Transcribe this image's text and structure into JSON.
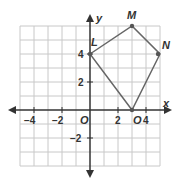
{
  "diagram": {
    "type": "coordinate-plane",
    "axes": {
      "x_label": "x",
      "y_label": "y",
      "origin_label": "O"
    },
    "x_ticks": [
      {
        "value": -4,
        "label": "−4"
      },
      {
        "value": -2,
        "label": "−2"
      },
      {
        "value": 2,
        "label": "2"
      },
      {
        "value": 4,
        "label": "4"
      }
    ],
    "y_ticks": [
      {
        "value": 4,
        "label": "4"
      },
      {
        "value": 2,
        "label": "2"
      },
      {
        "value": -2,
        "label": "−2"
      }
    ],
    "grid": {
      "x_min": -5,
      "x_max": 5,
      "y_min": -4,
      "y_max": 6
    },
    "polygon": {
      "vertices": [
        {
          "name": "L",
          "x": 0,
          "y": 4
        },
        {
          "name": "M",
          "x": 3,
          "y": 6
        },
        {
          "name": "N",
          "x": 5,
          "y": 4
        },
        {
          "name": "O",
          "x": 3,
          "y": 0
        }
      ],
      "color": "#666666"
    }
  }
}
